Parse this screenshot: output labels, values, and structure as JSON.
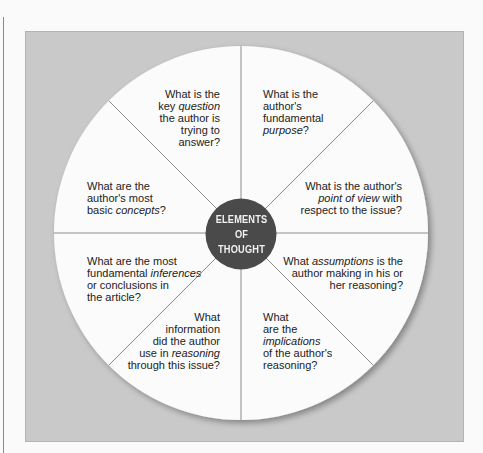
{
  "diagram": {
    "center": {
      "lines": [
        "ELEMENTS",
        "OF",
        "THOUGHT"
      ],
      "fill": "#4a4a4a",
      "text_color": "#f2f2f2"
    },
    "colors": {
      "background": "#fafafa",
      "panel": "#c9c9c9",
      "wheel": "#fbfbfb",
      "divider": "#8c8c8c",
      "text": "#222222"
    },
    "segments": [
      {
        "id": "question",
        "lines": [
          [
            "What is the"
          ],
          [
            "key ",
            {
              "em": "question"
            }
          ],
          [
            "the author is"
          ],
          [
            "trying to"
          ],
          [
            "answer?"
          ]
        ],
        "plain": [
          "What is the",
          "key question",
          "the author is",
          "trying to",
          "answer?"
        ]
      },
      {
        "id": "purpose",
        "plain": [
          "What is the",
          "author's",
          "fundamental",
          "purpose?"
        ]
      },
      {
        "id": "point-of-view",
        "plain": [
          "What is the author's",
          "point of view with",
          "respect to the issue?"
        ]
      },
      {
        "id": "assumptions",
        "plain": [
          "What assumptions is the",
          "author making in his or",
          "her reasoning?"
        ]
      },
      {
        "id": "implications",
        "plain": [
          "What",
          "are the",
          "implications",
          "of the author's",
          "reasoning?"
        ]
      },
      {
        "id": "information",
        "plain": [
          "What",
          "information",
          "did the author",
          "use in reasoning",
          "through this issue?"
        ]
      },
      {
        "id": "inferences",
        "plain": [
          "What are the most",
          "fundamental inferences",
          "or conclusions in",
          "the article?"
        ]
      },
      {
        "id": "concepts",
        "plain": [
          "What are the",
          "author's most",
          "basic concepts?"
        ]
      }
    ],
    "t": {
      "q1": "What is the",
      "q2a": "key ",
      "q2b": "question",
      "q3": "the author is",
      "q4": "trying to",
      "q5": "answer?",
      "p1": "What is the",
      "p2": "author's",
      "p3": "fundamental",
      "p4a": "purpose",
      "p4b": "?",
      "v1": "What is the author's",
      "v2a": "point of view",
      "v2b": " with",
      "v3": "respect to the issue?",
      "a1a": "What ",
      "a1b": "assumptions",
      "a1c": " is the",
      "a2": "author making in his or",
      "a3": "her reasoning?",
      "m1": "What",
      "m2": "are the",
      "m3": "implications",
      "m4": "of the author's",
      "m5": "reasoning?",
      "i1": "What",
      "i2": "information",
      "i3": "did the author",
      "i4a": "use in ",
      "i4b": "reasoning",
      "i5": "through this issue?",
      "f1": "What are the most",
      "f2a": "fundamental ",
      "f2b": "inferences",
      "f3": "or conclusions in",
      "f4": "the article?",
      "c1": "What are the",
      "c2": "author's most",
      "c3a": "basic ",
      "c3b": "concepts",
      "c3c": "?"
    }
  }
}
